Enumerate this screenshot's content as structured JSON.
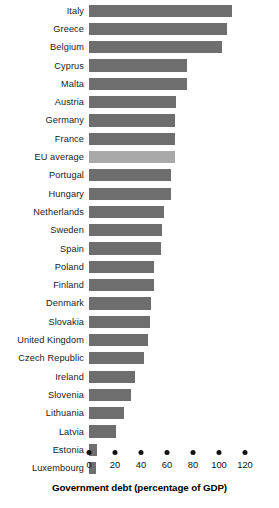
{
  "chart_data": {
    "type": "bar",
    "orientation": "horizontal",
    "title": "",
    "xlabel": "Government debt (percentage of GDP)",
    "ylabel": "",
    "xlim": [
      0,
      125
    ],
    "xticks": [
      0,
      20,
      40,
      60,
      80,
      100,
      120
    ],
    "xtick_labels": [
      "0",
      "20",
      "40",
      "60",
      "80",
      "100",
      "120"
    ],
    "grid": false,
    "legend": false,
    "bar_color": "#6e6e6e",
    "highlight_color": "#a9a9a9",
    "highlight_category": "EU average",
    "categories": [
      "Italy",
      "Greece",
      "Belgium",
      "Cyprus",
      "Malta",
      "Austria",
      "Germany",
      "France",
      "EU average",
      "Portugal",
      "Hungary",
      "Netherlands",
      "Sweden",
      "Spain",
      "Poland",
      "Finland",
      "Denmark",
      "Slovakia",
      "United Kingdom",
      "Czech Republic",
      "Ireland",
      "Slovenia",
      "Lithuania",
      "Latvia",
      "Estonia",
      "Luxembourg"
    ],
    "values": [
      110,
      106,
      102,
      75,
      75,
      67,
      66,
      66,
      66,
      63,
      63,
      58,
      56,
      55,
      50,
      50,
      48,
      47,
      45,
      42,
      35,
      32,
      27,
      21,
      6,
      5
    ]
  },
  "axis": {
    "title": "Government debt (percentage of GDP)"
  }
}
